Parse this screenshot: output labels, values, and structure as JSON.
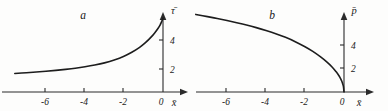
{
  "figure": {
    "background_color": "#fdfdfc",
    "ink_color": "#1d1d1d",
    "panel_count": 2
  },
  "panels": [
    {
      "id": "a",
      "letter": "a",
      "x_axis_label": "x̄",
      "y_axis_label": "τ̄",
      "x_tick_labels": [
        "-6",
        "-4",
        "-2",
        "0"
      ],
      "y_tick_labels": [
        "4",
        "2"
      ]
    },
    {
      "id": "b",
      "letter": "b",
      "x_axis_label": "x̄",
      "y_axis_label": "p̄",
      "x_tick_labels": [
        "-6",
        "-4",
        "-2",
        "0"
      ],
      "y_tick_labels": [
        "4",
        "2"
      ]
    }
  ],
  "chart_data": [
    {
      "type": "line",
      "title": "a",
      "xlabel": "x̄",
      "ylabel": "τ̄",
      "xlim": [
        -7.6,
        0.4
      ],
      "ylim": [
        0,
        6.2
      ],
      "xticks": [
        -6,
        -4,
        -2,
        0
      ],
      "yticks": [
        2,
        4
      ],
      "grid": false,
      "legend": "none",
      "series": [
        {
          "name": "τ̄(x̄)",
          "x": [
            -7.6,
            -7.0,
            -6.5,
            -6.0,
            -5.5,
            -5.0,
            -4.5,
            -4.0,
            -3.5,
            -3.0,
            -2.5,
            -2.0,
            -1.6,
            -1.2,
            -0.9,
            -0.6,
            -0.4,
            -0.25,
            -0.15,
            -0.08,
            -0.03,
            0.0
          ],
          "y": [
            1.28,
            1.33,
            1.38,
            1.43,
            1.49,
            1.56,
            1.64,
            1.74,
            1.86,
            2.01,
            2.21,
            2.47,
            2.74,
            3.08,
            3.4,
            3.8,
            4.12,
            4.4,
            4.62,
            4.82,
            4.98,
            5.1
          ]
        }
      ]
    },
    {
      "type": "line",
      "title": "b",
      "xlabel": "x̄",
      "ylabel": "p̄",
      "xlim": [
        -7.6,
        0.4
      ],
      "ylim": [
        0,
        6.2
      ],
      "xticks": [
        -6,
        -4,
        -2,
        0
      ],
      "yticks": [
        2,
        4
      ],
      "grid": false,
      "legend": "none",
      "series": [
        {
          "name": "p̄(x̄)",
          "x": [
            -7.6,
            -7.0,
            -6.5,
            -6.0,
            -5.5,
            -5.0,
            -4.5,
            -4.0,
            -3.5,
            -3.0,
            -2.5,
            -2.0,
            -1.6,
            -1.2,
            -0.9,
            -0.6,
            -0.4,
            -0.25,
            -0.15,
            -0.08,
            -0.03,
            0.0
          ],
          "y": [
            5.35,
            5.2,
            5.07,
            4.93,
            4.78,
            4.62,
            4.44,
            4.24,
            4.02,
            3.77,
            3.47,
            3.12,
            2.8,
            2.42,
            2.09,
            1.71,
            1.39,
            1.1,
            0.85,
            0.62,
            0.38,
            0.0
          ]
        }
      ]
    }
  ]
}
